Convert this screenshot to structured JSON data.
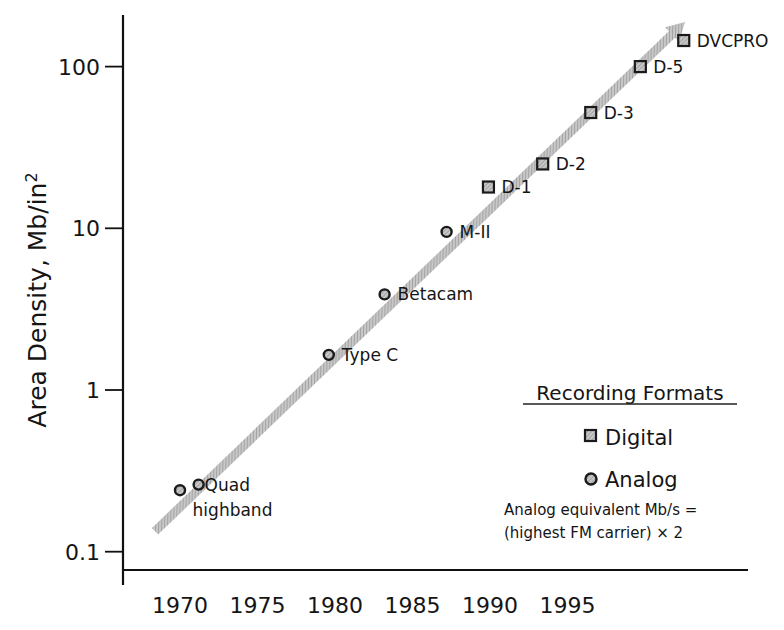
{
  "chart_data": {
    "type": "scatter",
    "title": "",
    "xlabel": "",
    "ylabel": "Area Density, Mb/in²",
    "ylabel_main": "Area Density, Mb/in",
    "ylabel_sup": "2",
    "yscale": "log",
    "ylim": [
      0.08,
      250
    ],
    "grid": false,
    "x_ticks": [
      "1970",
      "1975",
      "1980",
      "1985",
      "1990",
      "1995"
    ],
    "y_ticks": [
      "0.1",
      "1",
      "10",
      "100"
    ],
    "legend": {
      "position": "lower right",
      "title": "Recording Formats",
      "entries": [
        {
          "label": "Digital",
          "marker": "square"
        },
        {
          "label": "Analog",
          "marker": "circle"
        }
      ],
      "note_line1": "Analog equivalent Mb/s =",
      "note_line2": "(highest FM carrier) × 2"
    },
    "trend_arrow": {
      "from": {
        "year": 1970.0,
        "value": 0.15
      },
      "to": {
        "year": 1996.5,
        "value": 200
      }
    },
    "series": [
      {
        "name": "Analog",
        "marker": "circle",
        "points": [
          {
            "label": "",
            "year": 1970.0,
            "value": 0.24
          },
          {
            "label": "Quad highband",
            "label_lines": [
              "Quad",
              "highband"
            ],
            "year": 1971.2,
            "value": 0.26
          },
          {
            "label": "Type C",
            "year": 1979.6,
            "value": 1.65
          },
          {
            "label": "Betacam",
            "year": 1983.2,
            "value": 3.9
          },
          {
            "label": "M-II",
            "year": 1987.2,
            "value": 9.5
          }
        ]
      },
      {
        "name": "Digital",
        "marker": "square",
        "points": [
          {
            "label": "D-1",
            "year": 1989.9,
            "value": 18
          },
          {
            "label": "D-2",
            "year": 1993.4,
            "value": 25
          },
          {
            "label": "D-3",
            "year": 1996.5,
            "value": 52
          },
          {
            "label": "D-5",
            "year": 1999.7,
            "value": 100
          },
          {
            "label": "DVCPRO",
            "year": 2002.5,
            "value": 145
          }
        ]
      }
    ],
    "colors": {
      "axis": "#111111",
      "marker_fill": "#9a9a9a",
      "marker_stroke": "#1a1a1a",
      "arrow": "#a8a8a8"
    }
  }
}
